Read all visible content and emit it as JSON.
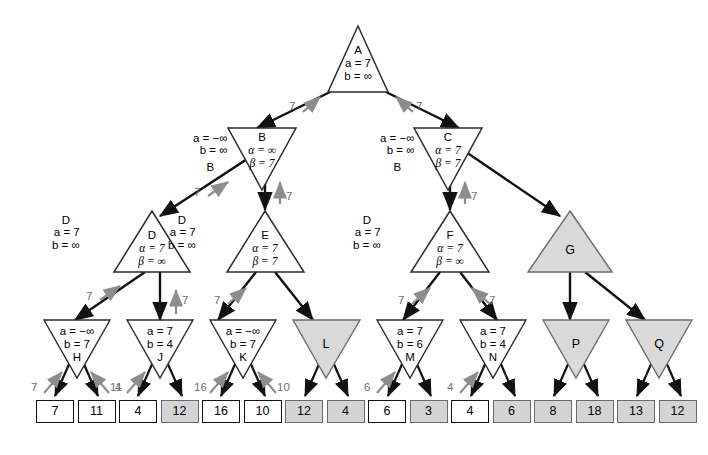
{
  "diagram": {
    "colors": {
      "pruned_fill": "#d9d9d9",
      "node_stroke": "#2b2b2b",
      "arrow_gray": "#8d8d8d",
      "leaf_shaded": "#d4d4d4"
    }
  },
  "nodes": {
    "A": {
      "name": "A",
      "line1": "a = 7",
      "line2": "b = ∞",
      "shape": "max-triangle",
      "pruned": false
    },
    "B": {
      "name": "B",
      "line1": "α = ∞",
      "line2": "β = 7",
      "shape": "min-triangle",
      "pruned": false,
      "side_l1": "a = −∞",
      "side_l2": "b = ∞",
      "side_l3": "B"
    },
    "C": {
      "name": "C",
      "line1": "α = 7",
      "line2": "β = 7",
      "shape": "min-triangle",
      "pruned": false,
      "side_l1": "a = −∞",
      "side_l2": "b = ∞",
      "side_l3": "B"
    },
    "D": {
      "name": "D",
      "line1": "α = 7",
      "line2": "β = ∞",
      "shape": "max-triangle",
      "pruned": false,
      "side_l0": "D",
      "side_l1": "a = 7",
      "side_l2": "b = ∞"
    },
    "E": {
      "name": "E",
      "line1": "α = 7",
      "line2": "β = 7",
      "shape": "max-triangle",
      "pruned": false,
      "side_l0": "D",
      "side_l1": "a = 7",
      "side_l2": "b = ∞"
    },
    "F": {
      "name": "F",
      "line1": "α = 7",
      "line2": "β = ∞",
      "shape": "max-triangle",
      "pruned": false,
      "side_l0": "D",
      "side_l1": "a = 7",
      "side_l2": "b = ∞"
    },
    "G": {
      "name": "G",
      "shape": "max-triangle",
      "pruned": true
    },
    "H": {
      "name": "H",
      "line1": "a = −∞",
      "line2": "b = 7",
      "shape": "min-triangle",
      "pruned": false
    },
    "J": {
      "name": "J",
      "line1": "a = 7",
      "line2": "b = 4",
      "shape": "min-triangle",
      "pruned": false
    },
    "K": {
      "name": "K",
      "line1": "a = −∞",
      "line2": "b = 7",
      "shape": "min-triangle",
      "pruned": false
    },
    "L": {
      "name": "L",
      "shape": "min-triangle",
      "pruned": true
    },
    "M": {
      "name": "M",
      "line1": "a = 7",
      "line2": "b = 6",
      "shape": "min-triangle",
      "pruned": false
    },
    "N": {
      "name": "N",
      "line1": "a = 7",
      "line2": "b = 4",
      "shape": "min-triangle",
      "pruned": false
    },
    "P": {
      "name": "P",
      "shape": "min-triangle",
      "pruned": true
    },
    "Q": {
      "name": "Q",
      "shape": "min-triangle",
      "pruned": true
    }
  },
  "leaves": [
    {
      "value": "7",
      "shaded": false
    },
    {
      "value": "11",
      "shaded": false
    },
    {
      "value": "4",
      "shaded": false
    },
    {
      "value": "12",
      "shaded": true
    },
    {
      "value": "16",
      "shaded": false
    },
    {
      "value": "10",
      "shaded": false
    },
    {
      "value": "12",
      "shaded": true
    },
    {
      "value": "4",
      "shaded": true
    },
    {
      "value": "6",
      "shaded": false
    },
    {
      "value": "3",
      "shaded": true
    },
    {
      "value": "4",
      "shaded": false
    },
    {
      "value": "6",
      "shaded": true
    },
    {
      "value": "8",
      "shaded": true
    },
    {
      "value": "18",
      "shaded": true
    },
    {
      "value": "13",
      "shaded": true
    },
    {
      "value": "12",
      "shaded": true
    }
  ],
  "backup_labels": {
    "a_to_b": "7",
    "a_to_c": "7",
    "b_to_d": "7",
    "b_to_e": "7",
    "c_to_f": "7",
    "d_to_h": "7",
    "d_to_j": "7",
    "e_to_k": "7",
    "f_to_m": "7",
    "f_to_n": "7",
    "h_left": "7",
    "h_right": "11",
    "j_left": "4",
    "k_left": "16",
    "k_right": "10",
    "m_left": "6",
    "n_left": "4"
  }
}
